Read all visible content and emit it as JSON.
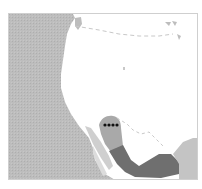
{
  "map": {
    "type": "species-distribution-range-map",
    "region": "Western North America",
    "colors": {
      "ocean": "#b9b9b9",
      "land": "#ffffff",
      "border_lines": "#c8c8c8",
      "range_light": "#a9a9a9",
      "range_dark": "#6f6f6f",
      "range_outer_light": "#c4c4c4",
      "record_points": "#111111",
      "frame": "#cfcfcf"
    },
    "layers": [
      {
        "name": "ocean",
        "description": "Pacific Ocean, gray hatched fill on left side"
      },
      {
        "name": "land",
        "description": "North American landmass, white"
      },
      {
        "name": "border",
        "description": "Dashed international border (US–Canada, US–Mexico)"
      },
      {
        "name": "range-light",
        "description": "Light gray range in Sonora / northwest Mexico"
      },
      {
        "name": "range-dark",
        "description": "Dark gray range along western Mexico"
      },
      {
        "name": "range-outer",
        "description": "Light gray area in south-east Mexico"
      },
      {
        "name": "record-points",
        "count": 4,
        "description": "Black dots near US–Mexico border (southern Arizona)"
      }
    ]
  }
}
